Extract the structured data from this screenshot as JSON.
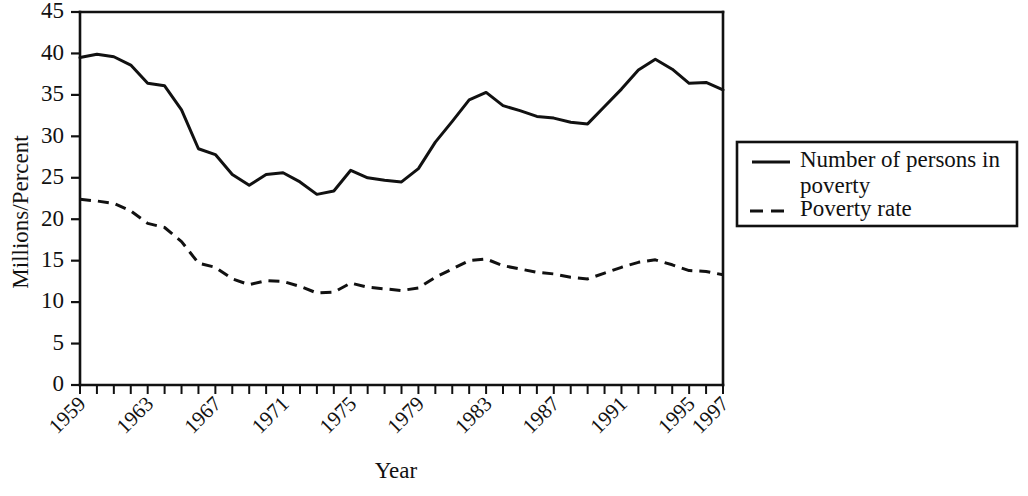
{
  "chart_data": {
    "type": "line",
    "title": "",
    "xlabel": "Year",
    "ylabel": "Millions/Percent",
    "xlim": [
      1959,
      1997
    ],
    "ylim": [
      0,
      45
    ],
    "grid": false,
    "legend_position": "right",
    "y_ticks": [
      0,
      5,
      10,
      15,
      20,
      25,
      30,
      35,
      40,
      45
    ],
    "y_tick_labels": [
      "0",
      "5",
      "10",
      "15",
      "20",
      "25",
      "30",
      "35",
      "40",
      "45"
    ],
    "x_ticks": [
      1959,
      1960,
      1961,
      1962,
      1963,
      1964,
      1965,
      1966,
      1967,
      1968,
      1969,
      1970,
      1971,
      1972,
      1973,
      1974,
      1975,
      1976,
      1977,
      1978,
      1979,
      1980,
      1981,
      1982,
      1983,
      1984,
      1985,
      1986,
      1987,
      1988,
      1989,
      1990,
      1991,
      1992,
      1993,
      1994,
      1995,
      1996,
      1997
    ],
    "x_tick_labels_shown": [
      "1959",
      "1963",
      "1967",
      "1971",
      "1975",
      "1979",
      "1983",
      "1987",
      "1991",
      "1995",
      "1997"
    ],
    "x": [
      1959,
      1960,
      1961,
      1962,
      1963,
      1964,
      1965,
      1966,
      1967,
      1968,
      1969,
      1970,
      1971,
      1972,
      1973,
      1974,
      1975,
      1976,
      1977,
      1978,
      1979,
      1980,
      1981,
      1982,
      1983,
      1984,
      1985,
      1986,
      1987,
      1988,
      1989,
      1990,
      1991,
      1992,
      1993,
      1994,
      1995,
      1996,
      1997
    ],
    "series": [
      {
        "name": "Number of persons in poverty",
        "style": "solid",
        "units": "millions",
        "values": [
          39.5,
          39.9,
          39.6,
          38.6,
          36.4,
          36.1,
          33.2,
          28.5,
          27.8,
          25.4,
          24.1,
          25.4,
          25.6,
          24.5,
          23.0,
          23.4,
          25.9,
          25.0,
          24.7,
          24.5,
          26.1,
          29.3,
          31.8,
          34.4,
          35.3,
          33.7,
          33.1,
          32.4,
          32.2,
          31.7,
          31.5,
          33.6,
          35.7,
          38.0,
          39.3,
          38.1,
          36.4,
          36.5,
          35.6
        ]
      },
      {
        "name": "Poverty rate",
        "style": "dashed",
        "units": "percent",
        "values": [
          22.4,
          22.2,
          21.9,
          21.0,
          19.5,
          19.0,
          17.3,
          14.7,
          14.2,
          12.8,
          12.1,
          12.6,
          12.5,
          11.9,
          11.1,
          11.2,
          12.3,
          11.8,
          11.6,
          11.4,
          11.7,
          13.0,
          14.0,
          15.0,
          15.2,
          14.4,
          14.0,
          13.6,
          13.4,
          13.0,
          12.8,
          13.5,
          14.2,
          14.8,
          15.1,
          14.5,
          13.8,
          13.7,
          13.3
        ]
      }
    ]
  },
  "legend": {
    "entries": [
      {
        "label_line1": "Number of persons in",
        "label_line2": "poverty",
        "style": "solid"
      },
      {
        "label_line1": "Poverty rate",
        "label_line2": "",
        "style": "dashed"
      }
    ]
  }
}
